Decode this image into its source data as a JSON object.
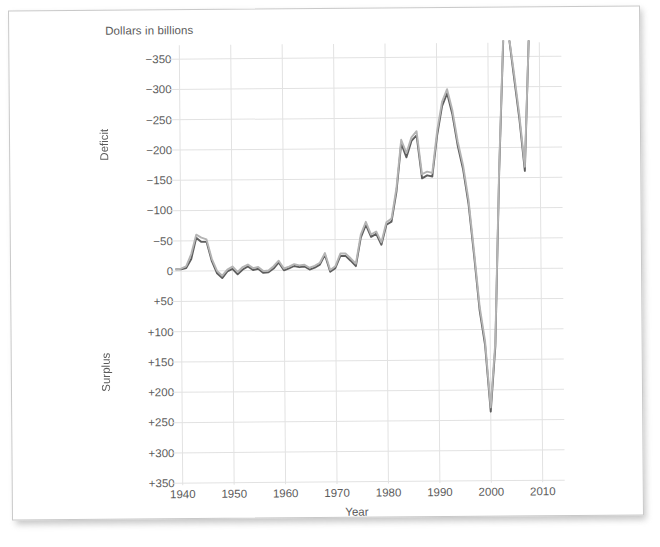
{
  "chart_data": {
    "type": "line",
    "title": "",
    "subtitle": "",
    "unit_label": "Dollars in billions",
    "xlabel": "Year",
    "ylabel_upper": "Deficit",
    "ylabel_lower": "Surplus",
    "y_inverted": true,
    "grid": true,
    "legend_position": "none",
    "xlim": [
      1938,
      2011
    ],
    "ylim": [
      -375,
      375
    ],
    "x_ticks": [
      1940,
      1950,
      1960,
      1970,
      1980,
      1990,
      2000,
      2010
    ],
    "x_tick_labels": [
      "1940",
      "1950",
      "1960",
      "1970",
      "1980",
      "1990",
      "2000",
      "2010"
    ],
    "y_ticks": [
      -350,
      -300,
      -250,
      -200,
      -150,
      -100,
      -50,
      0,
      50,
      100,
      150,
      200,
      250,
      300,
      350
    ],
    "y_tick_labels": [
      "−350",
      "−300",
      "−250",
      "−200",
      "−150",
      "−100",
      "−50",
      "0",
      "+50",
      "+100",
      "+150",
      "+200",
      "+250",
      "+300",
      "+350"
    ],
    "colors": {
      "series_dark": "#5d5d5d",
      "series_light": "#b4b4b4",
      "grid": "#e2e2e2",
      "text": "#5b5b5b",
      "page": "#ffffff",
      "page_border": "#c9c9c9"
    },
    "x": [
      1939,
      1940,
      1941,
      1942,
      1943,
      1944,
      1945,
      1946,
      1947,
      1948,
      1949,
      1950,
      1951,
      1952,
      1953,
      1954,
      1955,
      1956,
      1957,
      1958,
      1959,
      1960,
      1961,
      1962,
      1963,
      1964,
      1965,
      1966,
      1967,
      1968,
      1969,
      1970,
      1971,
      1972,
      1973,
      1974,
      1975,
      1976,
      1977,
      1978,
      1979,
      1980,
      1981,
      1982,
      1983,
      1984,
      1985,
      1986,
      1987,
      1988,
      1989,
      1990,
      1991,
      1992,
      1993,
      1994,
      1995,
      1996,
      1997,
      1998,
      1999,
      2000,
      2001,
      2002,
      2003,
      2004,
      2005,
      2006,
      2007,
      2008,
      2009,
      2010
    ],
    "series": [
      {
        "name": "Series A (dark)",
        "color": "#5d5d5d",
        "values": [
          -3,
          -3,
          -5,
          -20,
          -55,
          -48,
          -48,
          -16,
          4,
          12,
          1,
          -3,
          6,
          -2,
          -7,
          -1,
          -3,
          4,
          3,
          -3,
          -13,
          0,
          -3,
          -7,
          -5,
          -6,
          -1,
          -4,
          -9,
          -25,
          3,
          -3,
          -23,
          -23,
          -15,
          -6,
          -53,
          -74,
          -54,
          -59,
          -41,
          -74,
          -79,
          -128,
          -208,
          -185,
          -212,
          -221,
          -150,
          -155,
          -153,
          -221,
          -269,
          -290,
          -255,
          -203,
          -164,
          -107,
          -22,
          69,
          126,
          236,
          128,
          -158,
          -378,
          -413,
          -318,
          -248,
          -161,
          -459,
          -1413,
          -1294
        ]
      },
      {
        "name": "Series B (light)",
        "color": "#b4b4b4",
        "values": [
          -3,
          -4,
          -8,
          -28,
          -60,
          -55,
          -52,
          -20,
          0,
          8,
          -2,
          -7,
          2,
          -6,
          -10,
          -4,
          -6,
          1,
          0,
          -7,
          -16,
          -3,
          -6,
          -10,
          -8,
          -9,
          -4,
          -7,
          -12,
          -28,
          0,
          -6,
          -27,
          -27,
          -19,
          -10,
          -58,
          -79,
          -58,
          -63,
          -45,
          -78,
          -84,
          -134,
          -214,
          -192,
          -218,
          -228,
          -157,
          -161,
          -159,
          -228,
          -276,
          -297,
          -262,
          -210,
          -171,
          -114,
          -29,
          62,
          119,
          229,
          121,
          -165,
          -385,
          -420,
          -325,
          -255,
          -168,
          -466,
          -1420,
          -1301
        ]
      }
    ],
    "series_display_note": "Plot clips below +360 surplus; two nearly-parallel gray traces"
  },
  "page": {
    "unit_label": "Dollars in billions"
  }
}
